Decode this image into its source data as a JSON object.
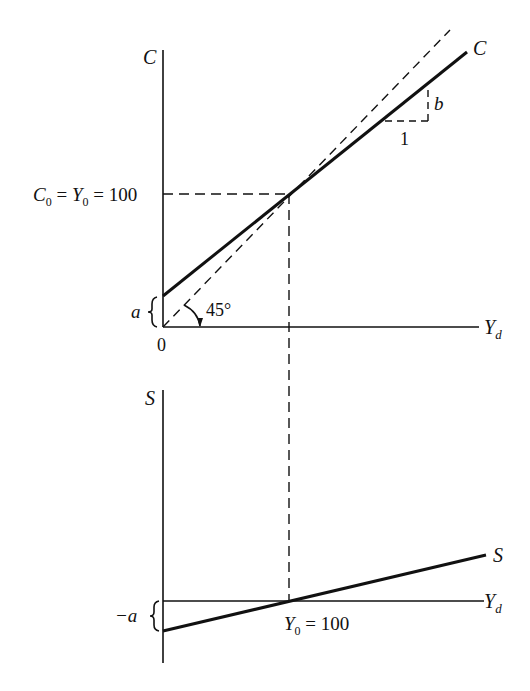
{
  "figure": {
    "top_panel": {
      "y_axis_label": "C",
      "x_axis_label": "Y",
      "x_axis_label_sub": "d",
      "origin_label": "0",
      "equilibrium_label": {
        "c0": "C",
        "c0_sub": "0",
        "eq1": " = ",
        "y0": "Y",
        "y0_sub": "0",
        "eq2": " = 100"
      },
      "intercept_label": "a",
      "angle_label": "45°",
      "consumption_line_label": "C",
      "slope_rise_label": "b",
      "slope_run_label": "1"
    },
    "bottom_panel": {
      "y_axis_label": "S",
      "x_axis_label": "Y",
      "x_axis_label_sub": "d",
      "intercept_label": "−a",
      "saving_line_label": "S",
      "equilibrium_label": {
        "y0": "Y",
        "y0_sub": "0",
        "eq": " = 100"
      }
    },
    "colors": {
      "ink": "#111111",
      "background": "#ffffff"
    }
  }
}
